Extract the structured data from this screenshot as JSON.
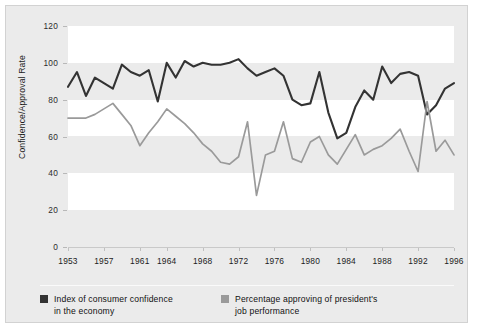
{
  "chart_data": {
    "type": "line",
    "title": "",
    "xlabel": "",
    "ylabel": "Confidence/Approval Rate",
    "ylim": [
      0,
      120
    ],
    "yticks": [
      0,
      20,
      40,
      60,
      80,
      100,
      120
    ],
    "xlim": [
      1953,
      1996
    ],
    "xticks": [
      1953,
      1957,
      1961,
      1964,
      1968,
      1972,
      1976,
      1980,
      1984,
      1988,
      1992,
      1996
    ],
    "grid": "horizontal-bands",
    "legend_position": "bottom",
    "x": [
      1953,
      1954,
      1955,
      1956,
      1957,
      1958,
      1959,
      1960,
      1961,
      1962,
      1963,
      1964,
      1965,
      1966,
      1967,
      1968,
      1969,
      1970,
      1971,
      1972,
      1973,
      1974,
      1975,
      1976,
      1977,
      1978,
      1979,
      1980,
      1981,
      1982,
      1983,
      1984,
      1985,
      1986,
      1987,
      1988,
      1989,
      1990,
      1991,
      1992,
      1993,
      1994,
      1995,
      1996
    ],
    "series": [
      {
        "name": "Index of consumer confidence in the economy",
        "color": "#333333",
        "values": [
          87,
          95,
          82,
          92,
          89,
          86,
          99,
          95,
          93,
          96,
          79,
          100,
          92,
          101,
          98,
          100,
          99,
          99,
          100,
          102,
          97,
          93,
          95,
          97,
          93,
          80,
          77,
          78,
          95,
          73,
          59,
          62,
          76,
          85,
          80,
          98,
          89,
          94,
          95,
          93,
          72,
          77,
          86,
          89
        ]
      },
      {
        "name": "Percentage approving of president's job performance",
        "color": "#9a9a9a",
        "values": [
          70,
          70,
          70,
          72,
          75,
          78,
          72,
          66,
          55,
          62,
          68,
          75,
          71,
          67,
          62,
          56,
          52,
          46,
          45,
          49,
          68,
          28,
          50,
          52,
          68,
          48,
          46,
          57,
          60,
          50,
          45,
          53,
          61,
          50,
          53,
          55,
          59,
          64,
          52,
          41,
          79,
          52,
          58,
          50
        ]
      }
    ]
  },
  "axis": {
    "y_title": "Confidence/Approval Rate",
    "y_ticks": [
      "120",
      "100",
      "80",
      "60",
      "40",
      "20",
      "0"
    ],
    "x_ticks": [
      "1953",
      "1957",
      "1961",
      "1964",
      "1968",
      "1972",
      "1976",
      "1980",
      "1984",
      "1988",
      "1992",
      "1996"
    ]
  },
  "legend": {
    "items": [
      {
        "label": "Index of consumer confidence\nin the economy",
        "color": "#333333"
      },
      {
        "label": "Percentage approving of president's\njob performance",
        "color": "#9a9a9a"
      }
    ]
  }
}
